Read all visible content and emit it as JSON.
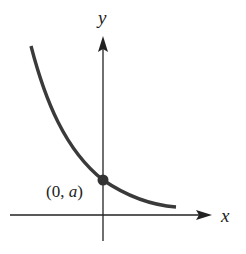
{
  "figure": {
    "type": "exponential-decay-graph",
    "axes": {
      "x_label": "x",
      "y_label": "y"
    },
    "point": {
      "label_open": "(0, ",
      "label_var": "a",
      "label_close": ")",
      "coords": "(0, a)"
    },
    "colors": {
      "curve": "#3a3a3a",
      "axes": "#222222",
      "point": "#333333",
      "background": "#ffffff"
    }
  }
}
